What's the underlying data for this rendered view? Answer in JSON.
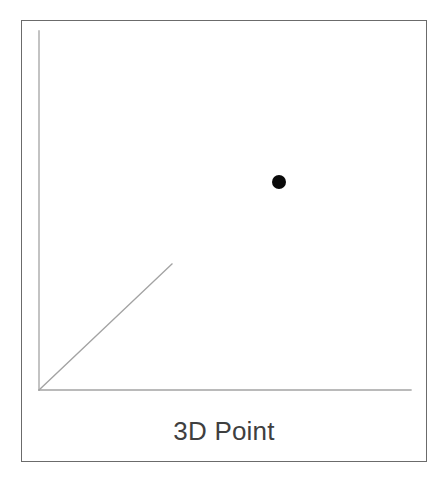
{
  "figure": {
    "caption": "3D Point",
    "background_color": "#ffffff",
    "frame": {
      "name": "card-border",
      "color": "#6b6b6b",
      "x": 21,
      "y": 20,
      "width": 406,
      "height": 442,
      "stroke_width": 1.6
    }
  },
  "chart_data": {
    "type": "scatter",
    "title": "3D Point",
    "subtitle": "",
    "xlabel": "",
    "ylabel": "",
    "zlabel": "",
    "grid": false,
    "legend": null,
    "projection": "3d-isometric-schematic",
    "axis_color": "#a3a3a3",
    "axis_stroke_width": 1.3,
    "axes": [
      {
        "name": "y-axis",
        "label": "",
        "from": [
          39,
          390
        ],
        "to": [
          39,
          31
        ],
        "direction": "up"
      },
      {
        "name": "x-axis",
        "label": "",
        "from": [
          39,
          390
        ],
        "to": [
          411,
          390
        ],
        "direction": "right"
      },
      {
        "name": "z-axis",
        "label": "",
        "from": [
          39,
          390
        ],
        "to": [
          172,
          264
        ],
        "direction": "up-right-diagonal"
      }
    ],
    "origin": [
      39,
      390
    ],
    "points": [
      {
        "name": "data-point",
        "label": "",
        "cx": 279,
        "cy": 182,
        "r": 7,
        "color": "#0a0a0a"
      }
    ],
    "values": [
      {
        "x": 0.645,
        "y": 0.58,
        "note": "normalized position of the plotted point within the x/y axis extents"
      }
    ],
    "xlim": [
      0,
      372
    ],
    "ylim": [
      0,
      359
    ],
    "tick_labels": {
      "x": [],
      "y": [],
      "z": []
    }
  },
  "caption_style": {
    "color": "#3f3f3f",
    "font_size_px": 26
  }
}
